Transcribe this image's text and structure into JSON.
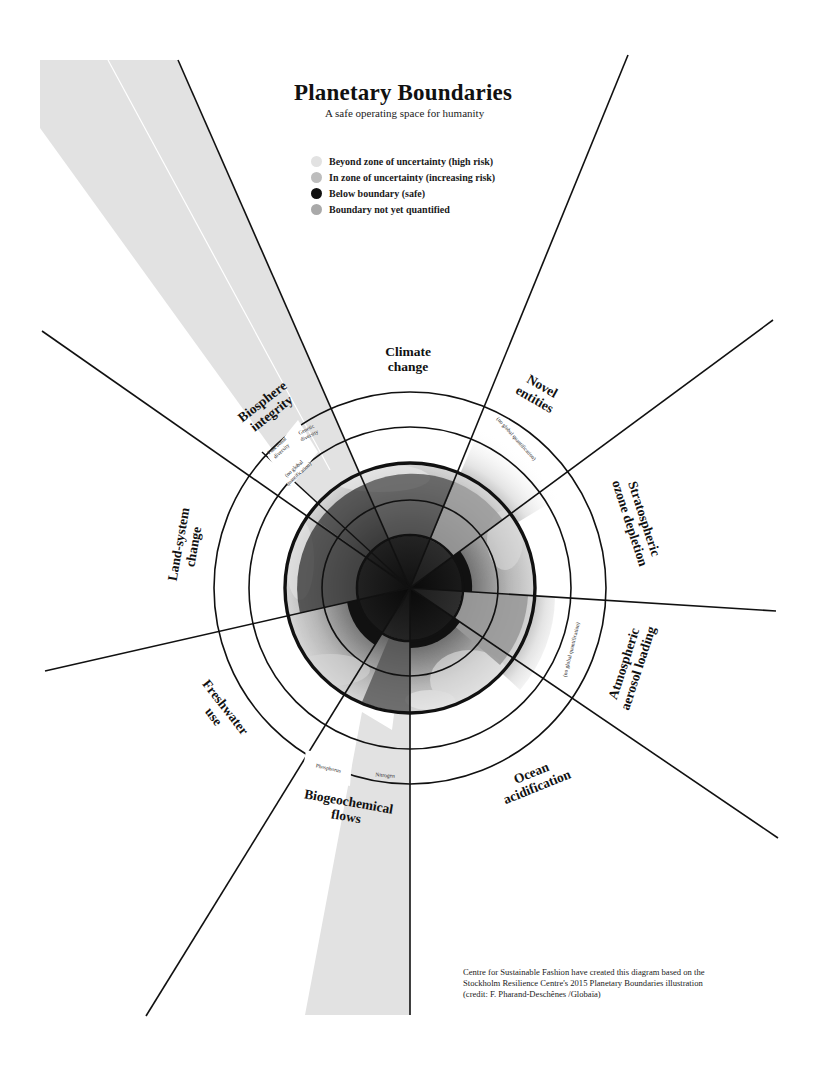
{
  "header": {
    "title": "Planetary Boundaries",
    "subtitle": "A safe operating space for humanity"
  },
  "legend": [
    {
      "label": "Beyond zone of uncertainty (high risk)",
      "color": "#e2e2e2"
    },
    {
      "label": "In zone of uncertainty (increasing risk)",
      "color": "#bdbdbd"
    },
    {
      "label": "Below boundary (safe)",
      "color": "#111111"
    },
    {
      "label": "Boundary not yet quantified",
      "color": "#a9a9a9"
    }
  ],
  "segments": [
    {
      "name": "Climate change",
      "line1": "Climate",
      "line2": "change"
    },
    {
      "name": "Novel entities",
      "line1": "Novel",
      "line2": "entities",
      "note": "(no global quantification)"
    },
    {
      "name": "Stratospheric ozone depletion",
      "line1": "Stratospheric",
      "line2": "ozone depletion"
    },
    {
      "name": "Atmospheric aerosol loading",
      "line1": "Atmospheric",
      "line2": "aerosol loading",
      "note": "(no global quantification)"
    },
    {
      "name": "Ocean acidification",
      "line1": "Ocean",
      "line2": "acidification"
    },
    {
      "name": "Biogeochemical flows",
      "line1": "Biogeochemical",
      "line2": "flows",
      "sub": [
        "Phosphorus",
        "Nitrogen"
      ]
    },
    {
      "name": "Freshwater use",
      "line1": "Freshwater",
      "line2": "use"
    },
    {
      "name": "Land-system change",
      "line1": "Land-system",
      "line2": "change"
    },
    {
      "name": "Biosphere integrity",
      "line1": "Biosphere",
      "line2": "integrity",
      "sub": [
        "Functional diversity",
        "Genetic diversity"
      ],
      "sub_note": "(no global quantification)"
    }
  ],
  "labels": {
    "functional_1": "Functional",
    "functional_2": "diversity",
    "genetic_1": "Genetic",
    "genetic_2": "diversity",
    "noquant_1": "(no global",
    "noquant_2": "quantification)",
    "noquant_full": "(no global quantification)",
    "phosphorus": "Phosphorus",
    "nitrogen": "Nitrogen"
  },
  "colors": {
    "high_risk": "#e2e2e2",
    "increasing_risk": "#bdbdbd",
    "safe": "#111111",
    "not_quantified": "#a9a9a9",
    "line": "#111111"
  },
  "credit": {
    "line1": "Centre for Sustainable Fashion have created this diagram based on the",
    "line2": "Stockholm Resilience Centre's 2015 Planetary Boundaries illustration",
    "line3": "(credit: F. Pharand-Deschênes /Globaïa)"
  }
}
